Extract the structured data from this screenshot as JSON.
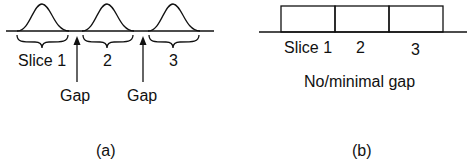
{
  "panel_a": {
    "slice_labels": [
      "Slice 1",
      "2",
      "3"
    ],
    "gap_labels": [
      "Gap",
      "Gap"
    ],
    "caption": "(a)"
  },
  "panel_b": {
    "slice_labels": [
      "Slice 1",
      "2",
      "3"
    ],
    "note": "No/minimal gap",
    "caption": "(b)"
  }
}
